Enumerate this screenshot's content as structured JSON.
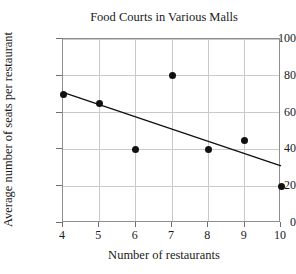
{
  "chart_data": {
    "type": "scatter",
    "title": "Food Courts in Various Malls",
    "xlabel": "Number of restaurants",
    "ylabel": "Average number of seats per restaurant",
    "x": [
      4,
      5,
      6,
      7,
      8,
      9,
      10
    ],
    "values": [
      70,
      65,
      40,
      80,
      40,
      45,
      20
    ],
    "points": [
      {
        "x": 4,
        "y": 70
      },
      {
        "x": 5,
        "y": 65
      },
      {
        "x": 6,
        "y": 40
      },
      {
        "x": 7,
        "y": 80
      },
      {
        "x": 8,
        "y": 40
      },
      {
        "x": 9,
        "y": 45
      },
      {
        "x": 10,
        "y": 20
      }
    ],
    "trendline": {
      "x1": 4,
      "y1": 71,
      "x2": 10,
      "y2": 31
    },
    "xlim": [
      4,
      10
    ],
    "ylim": [
      0,
      100
    ],
    "xticks": [
      4,
      5,
      6,
      7,
      8,
      9,
      10
    ],
    "yticks": [
      0,
      20,
      40,
      60,
      80,
      100
    ],
    "xtick_labels": [
      "4",
      "5",
      "6",
      "7",
      "8",
      "9",
      "10"
    ],
    "ytick_labels": [
      "0",
      "20",
      "40",
      "60",
      "80",
      "100"
    ],
    "grid": true,
    "legend": null,
    "marker_color": "#111111",
    "line_color": "#111111",
    "grid_color": "#c9c9c9",
    "frame_color": "#8e8e8e"
  }
}
